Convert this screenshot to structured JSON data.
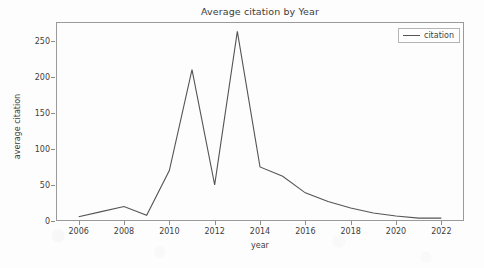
{
  "chart_data": {
    "type": "line",
    "title": "Average citation by Year",
    "xlabel": "year",
    "ylabel": "average citation",
    "grid": false,
    "legend_position": "upper right",
    "xlim": [
      2005,
      2023
    ],
    "ylim": [
      0,
      276
    ],
    "xticks": [
      2006,
      2008,
      2010,
      2012,
      2014,
      2016,
      2018,
      2020,
      2022
    ],
    "yticks": [
      0,
      50,
      100,
      150,
      200,
      250
    ],
    "x": [
      2006,
      2007,
      2008,
      2009,
      2010,
      2011,
      2012,
      2013,
      2014,
      2015,
      2016,
      2017,
      2018,
      2019,
      2020,
      2021,
      2022
    ],
    "series": [
      {
        "name": "citation",
        "color": "#555555",
        "values": [
          6,
          13,
          20,
          8,
          70,
          210,
          50,
          263,
          75,
          62,
          39,
          27,
          18,
          11,
          7,
          4,
          4
        ]
      }
    ]
  },
  "legend": {
    "entries": [
      {
        "label": "citation"
      }
    ]
  },
  "axis_labels": {
    "x": "year",
    "y": "average citation"
  }
}
